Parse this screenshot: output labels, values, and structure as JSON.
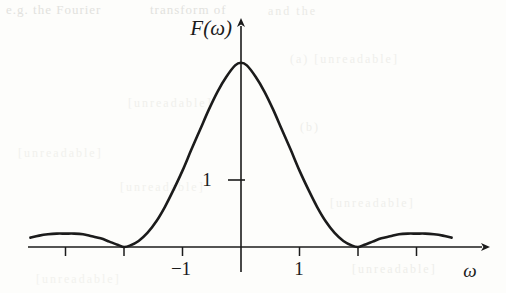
{
  "figure": {
    "background_color": "#fdfdfb",
    "ink_color": "#1b1b1b",
    "y_axis_label": "F(ω)",
    "x_axis_label": "ω",
    "y_tick_labels": [
      "1"
    ],
    "x_tick_labels": [
      "−1",
      "1"
    ],
    "ghost_text": {
      "line1a": "e.g. the Fourier",
      "line1b": "transform of",
      "line2": "and the",
      "line3": "(a) [unreadable]",
      "line4": "[unreadable]",
      "line5": "(b)",
      "line6": "[unreadable]",
      "line7": "[unreadable]",
      "line8": "[unreadable]",
      "line9": "[unreadable]",
      "line10": "[unreadable]"
    }
  },
  "chart_data": {
    "type": "line",
    "title": "",
    "subtitle": "",
    "xlabel": "ω",
    "ylabel": "F(ω)",
    "xlim": [
      -3.6,
      4.2
    ],
    "ylim": [
      -0.35,
      3.1
    ],
    "xticks": [
      -3,
      -2,
      -1,
      0,
      1,
      2,
      3
    ],
    "xtick_labels": [
      "",
      "",
      "-1",
      "",
      "1",
      "",
      ""
    ],
    "yticks": [
      1
    ],
    "ytick_labels": [
      "1"
    ],
    "grid": false,
    "legend": null,
    "axis_style": "arrow-terminated x and y axes through origin",
    "peak_value": 2.75,
    "peak_x": 0,
    "zero_crossings": [
      -2.0,
      2.0
    ],
    "sidelobe_peaks": [
      {
        "x": -2.85,
        "y": 0.2
      },
      {
        "x": 2.85,
        "y": 0.2
      }
    ],
    "series": [
      {
        "name": "F(ω)",
        "x": [
          -3.6,
          -3.45,
          -3.3,
          -3.15,
          -3.0,
          -2.85,
          -2.7,
          -2.55,
          -2.4,
          -2.25,
          -2.1,
          -2.0,
          -1.9,
          -1.75,
          -1.6,
          -1.45,
          -1.3,
          -1.15,
          -1.0,
          -0.85,
          -0.7,
          -0.55,
          -0.4,
          -0.25,
          -0.1,
          0.0,
          0.1,
          0.25,
          0.4,
          0.55,
          0.7,
          0.85,
          1.0,
          1.15,
          1.3,
          1.45,
          1.6,
          1.75,
          1.9,
          2.0,
          2.1,
          2.25,
          2.4,
          2.55,
          2.7,
          2.85,
          3.0,
          3.15,
          3.3,
          3.45,
          3.6
        ],
        "y": [
          0.14,
          0.17,
          0.19,
          0.2,
          0.2,
          0.2,
          0.19,
          0.16,
          0.13,
          0.08,
          0.03,
          0.0,
          0.02,
          0.09,
          0.21,
          0.38,
          0.6,
          0.86,
          1.14,
          1.45,
          1.75,
          2.05,
          2.32,
          2.54,
          2.71,
          2.75,
          2.71,
          2.54,
          2.32,
          2.05,
          1.75,
          1.45,
          1.14,
          0.86,
          0.6,
          0.38,
          0.21,
          0.09,
          0.02,
          0.0,
          0.03,
          0.08,
          0.13,
          0.16,
          0.19,
          0.2,
          0.2,
          0.2,
          0.19,
          0.17,
          0.14
        ]
      }
    ]
  }
}
